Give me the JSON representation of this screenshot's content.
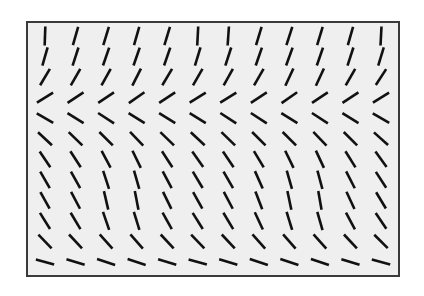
{
  "figure": {
    "type": "orientation-field-texture",
    "canvas": {
      "width": 424,
      "height": 296
    },
    "background_color": "#ffffff"
  },
  "panel": {
    "x": 26,
    "y": 21,
    "width": 374,
    "height": 256,
    "fill_color": "#efefef",
    "border_color": "#3a3a3a",
    "border_width": 2
  },
  "field": {
    "rows": 12,
    "cols": 12,
    "segment_color": "#111111",
    "segment_width": 2.6,
    "segment_length": 19,
    "margin_x": 17,
    "margin_y": 13,
    "angle_convention": "degrees clockwise from vertical; positive = top tilts left (backslash '\\'), negative = top tilts right (forward slash '/')",
    "angles": [
      [
        2,
        16,
        17,
        16,
        17,
        3,
        4,
        17,
        18,
        17,
        16,
        3
      ],
      [
        16,
        18,
        19,
        19,
        19,
        17,
        18,
        19,
        20,
        19,
        18,
        17
      ],
      [
        31,
        30,
        29,
        27,
        31,
        30,
        29,
        30,
        25,
        25,
        30,
        33
      ],
      [
        58,
        57,
        56,
        55,
        57,
        58,
        58,
        57,
        55,
        56,
        57,
        58
      ],
      [
        -60,
        -58,
        -57,
        -58,
        -58,
        -58,
        -57,
        -57,
        -58,
        -57,
        -58,
        -60
      ],
      [
        -47,
        -46,
        -45,
        -44,
        -46,
        -47,
        -46,
        -45,
        -45,
        -44,
        -45,
        -48
      ],
      [
        -34,
        -33,
        -28,
        -26,
        -33,
        -35,
        -34,
        -31,
        -26,
        -25,
        -32,
        -36
      ],
      [
        -30,
        -29,
        -18,
        -16,
        -28,
        -31,
        -30,
        -24,
        -16,
        -15,
        -27,
        -33
      ],
      [
        -29,
        -28,
        -13,
        -11,
        -26,
        -29,
        -28,
        -21,
        -12,
        -10,
        -25,
        -31
      ],
      [
        -32,
        -31,
        -19,
        -17,
        -29,
        -32,
        -31,
        -25,
        -17,
        -16,
        -28,
        -34
      ],
      [
        -44,
        -43,
        -42,
        -41,
        -43,
        -44,
        -43,
        -42,
        -41,
        -42,
        -43,
        -45
      ],
      [
        -74,
        -73,
        -72,
        -72,
        -73,
        -74,
        -73,
        -72,
        -72,
        -71,
        -73,
        -75
      ]
    ]
  }
}
